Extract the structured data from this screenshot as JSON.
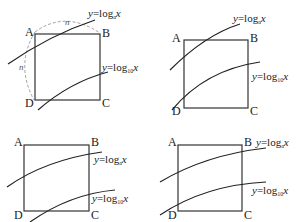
{
  "panels": [
    {
      "id": "top-left",
      "vertices": {
        "A": "A",
        "B": "B",
        "C": "C",
        "D": "D"
      },
      "curve1": {
        "prefix": "y=log",
        "base": "a",
        "var": "x"
      },
      "curve2": {
        "prefix": "y=log",
        "base": "10",
        "var": "x"
      },
      "arc_label_top": "n",
      "arc_label_left": "n"
    },
    {
      "id": "top-right",
      "vertices": {
        "A": "A",
        "B": "B",
        "C": "C",
        "D": "D"
      },
      "curve1": {
        "prefix": "y=log",
        "base": "a",
        "var": "x"
      },
      "curve2": {
        "prefix": "y=log",
        "base": "10",
        "var": "x"
      }
    },
    {
      "id": "bottom-left",
      "vertices": {
        "A": "A",
        "B": "B",
        "C": "C",
        "D": "D"
      },
      "curve1": {
        "prefix": "y=log",
        "base": "a",
        "var": "x"
      },
      "curve2": {
        "prefix": "y=log",
        "base": "10",
        "var": "x"
      }
    },
    {
      "id": "bottom-right",
      "vertices": {
        "A": "A",
        "B": "B",
        "C": "C",
        "D": "D"
      },
      "curve1": {
        "prefix": "y=log",
        "base": "a",
        "var": "x"
      },
      "curve2": {
        "prefix": "y=log",
        "base": "10",
        "var": "x"
      }
    }
  ]
}
